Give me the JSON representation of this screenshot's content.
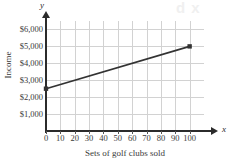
{
  "figure": {
    "watermark_text": "d x",
    "background_color": "#ffffff",
    "gridline_color": "#d2d2d2",
    "axis_color": "#2b2b2b",
    "series_color": "#333333"
  },
  "axis_letters": {
    "y": "y",
    "x": "x"
  },
  "chart_data": {
    "type": "line",
    "title": "",
    "xlabel": "Sets of golf clubs sold",
    "ylabel": "Income",
    "x": [
      0,
      100
    ],
    "values": [
      2500,
      5000
    ],
    "points": [
      {
        "x": 0,
        "y": 2500
      },
      {
        "x": 100,
        "y": 5000
      }
    ],
    "xlim": [
      0,
      110
    ],
    "ylim": [
      0,
      6500
    ],
    "xticks": [
      0,
      10,
      20,
      30,
      40,
      50,
      60,
      70,
      80,
      90,
      100
    ],
    "xticklabels": [
      "0",
      "10",
      "20",
      "30",
      "40",
      "50",
      "60",
      "70",
      "80",
      "90",
      "100"
    ],
    "yticks": [
      1000,
      2000,
      3000,
      4000,
      5000,
      6000
    ],
    "yticklabels": [
      "$1,000",
      "$2,000",
      "$3,000",
      "$4,000",
      "$5,000",
      "$6,000"
    ],
    "grid": true,
    "legend": false,
    "markers": "square",
    "series": [
      {
        "name": "Income",
        "values": [
          2500,
          5000
        ]
      }
    ]
  }
}
